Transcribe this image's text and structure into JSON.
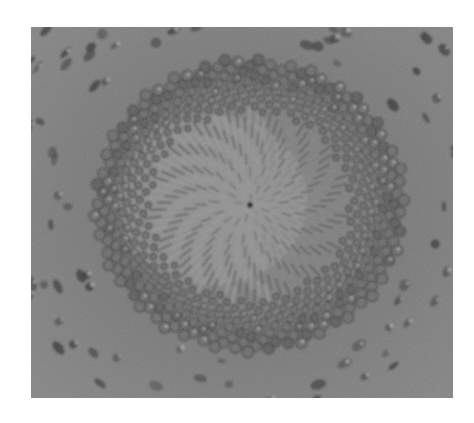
{
  "image": {
    "subject": "sunflower head seed spiral (grayscale photograph)",
    "frame": {
      "x": 31,
      "y": 27,
      "width": 422,
      "height": 371
    },
    "page_background": "#ffffff",
    "tones": {
      "background": "#7e7e7e",
      "background_light": "#8e8e8e",
      "center_light": "#a2a2a2",
      "floret": "#6e6e6e",
      "floret_dark": "#3a3a3a",
      "highlight": "#b8b8b8",
      "center_dot": "#2a2a2a"
    },
    "spiral": {
      "center_x": 219,
      "center_y": 178,
      "golden_angle_deg": 137.508,
      "count": 720,
      "scale": 5.6,
      "inner_radius_streaks": 95,
      "disk_radius": 150,
      "outer_radius": 230
    }
  }
}
